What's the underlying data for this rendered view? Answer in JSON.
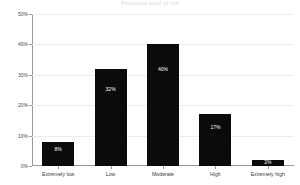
{
  "figure": {
    "clipped_title": "Perceived level of risk"
  },
  "chart_data": {
    "type": "bar",
    "title": "",
    "xlabel": "",
    "ylabel": "Percent of respondents",
    "categories": [
      "Extremely low",
      "Low",
      "Moderate",
      "High",
      "Extremely high"
    ],
    "values": [
      8,
      32,
      40,
      17,
      2
    ],
    "value_labels": [
      "8%",
      "32%",
      "40%",
      "17%",
      "2%"
    ],
    "ylim": [
      0,
      50
    ],
    "yticks": [
      0,
      10,
      20,
      30,
      40,
      50
    ],
    "ytick_labels": [
      "0%",
      "10%",
      "20%",
      "30%",
      "40%",
      "50%"
    ],
    "grid": true,
    "legend": false,
    "bar_color": "#0b0b0b",
    "value_label_color": "#ffffff",
    "gridline_color": "#ececed",
    "axis_color": "#9a9a9c",
    "background": "#ffffff"
  }
}
